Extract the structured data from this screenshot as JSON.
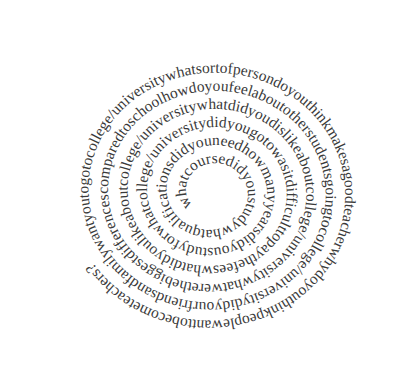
{
  "figure": {
    "type": "text-spiral",
    "text_color": "#3a3a3a",
    "background": "#ffffff",
    "direction": "clockwise, from center outward",
    "text": "whatcoursedidyoustudywhatqualificationsdidyouneedhowmanyyearsdidyoustudyforwhatcollege/universitydidyougotowasitdifficulttopaythefeeswhatdidyoulikeaboutcollege/universitywhatdidyoudislikeaboutcollege/universitywhatwerethebiggestdifferencescomparedtoschoolhowdoyoufeelaboutotherstudentsgoingtocollege/universitydidyourfriendsandfamilywantyoutogotocollege/universitywhatsortofpersondoyouthinkmakesagoodteacherwhydoyouthinkpeoplewanttobecometeachers?",
    "questions": [
      "what course did you study",
      "what qualifications did you need",
      "how many years did you study for",
      "what college/university did you go to",
      "was it difficult to pay the fees",
      "what did you like about college/university",
      "what did you dislike about college/university",
      "what were the biggest differences compared to school",
      "how do you feel about other students going to college/university",
      "did your friends and family want you to go to college/university",
      "what sort of person do you think makes a good teacher",
      "why do you think people want to become teachers?"
    ]
  }
}
